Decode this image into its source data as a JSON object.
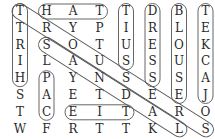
{
  "puzzle": {
    "grid": [
      [
        "T",
        "H",
        "A",
        "T",
        "T",
        "D",
        "B",
        "T"
      ],
      [
        "T",
        "R",
        "Y",
        "P",
        "I",
        "R",
        "L",
        "E"
      ],
      [
        "R",
        "S",
        "O",
        "T",
        "U",
        "E",
        "O",
        "K"
      ],
      [
        "I",
        "L",
        "A",
        "U",
        "S",
        "S",
        "U",
        "C"
      ],
      [
        "H",
        "P",
        "Y",
        "N",
        "S",
        "S",
        "S",
        "A"
      ],
      [
        "S",
        "A",
        "E",
        "T",
        "D",
        "E",
        "E",
        "J"
      ],
      [
        "T",
        "C",
        "E",
        "I",
        "T",
        "A",
        "R",
        "O"
      ],
      [
        "W",
        "F",
        "R",
        "T",
        "T",
        "K",
        "L",
        "S"
      ]
    ],
    "found_words": [
      {
        "word": "HAT",
        "start": [
          0,
          1
        ],
        "end": [
          0,
          3
        ]
      },
      {
        "word": "SHIRT",
        "start": [
          4,
          0
        ],
        "end": [
          0,
          0
        ]
      },
      {
        "word": "SUIT",
        "start": [
          3,
          4
        ],
        "end": [
          0,
          4
        ]
      },
      {
        "word": "DRESS",
        "start": [
          0,
          5
        ],
        "end": [
          4,
          5
        ]
      },
      {
        "word": "BLOUSE",
        "start": [
          0,
          6
        ],
        "end": [
          5,
          6
        ]
      },
      {
        "word": "JACKET",
        "start": [
          5,
          7
        ],
        "end": [
          0,
          7
        ]
      },
      {
        "word": "CAP",
        "start": [
          6,
          1
        ],
        "end": [
          4,
          1
        ]
      },
      {
        "word": "TIE",
        "start": [
          6,
          4
        ],
        "end": [
          6,
          2
        ]
      },
      {
        "word": "TROUSERS",
        "start": [
          0,
          0
        ],
        "end": [
          7,
          7
        ]
      },
      {
        "word": "SANDALS",
        "start": [
          2,
          1
        ],
        "end": [
          7,
          6
        ]
      }
    ]
  }
}
